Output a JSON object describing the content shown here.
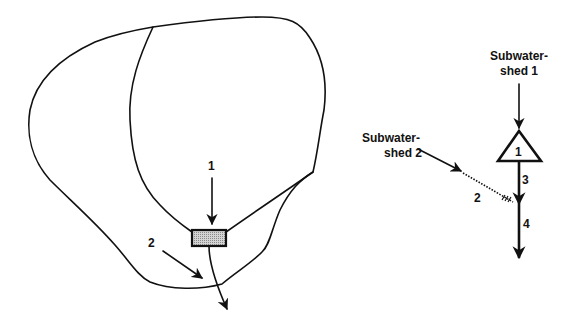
{
  "left_diagram": {
    "description": "Watershed map with two subwatersheds, a reservoir and outlet",
    "reservoir_label": "1",
    "inflow_label": "2",
    "reservoir_fill": "#b8b8b8"
  },
  "right_diagram": {
    "description": "Schematic network of watershed routing",
    "subwatershed1_line1": "Subwater-",
    "subwatershed1_line2": "shed 1",
    "subwatershed2_line1": "Subwater-",
    "subwatershed2_line2": "shed 2",
    "reservoir_node_label": "1",
    "reach2_label": "2",
    "reach3_label": "3",
    "reach4_label": "4"
  },
  "colors": {
    "line": "#111111",
    "background": "#ffffff"
  }
}
